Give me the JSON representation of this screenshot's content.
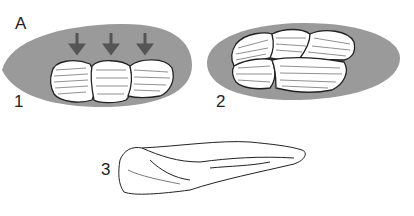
{
  "figure": {
    "panel_label": "A",
    "items": [
      {
        "label": "1",
        "description": "three flakes in a row with downward arrows on gray core"
      },
      {
        "label": "2",
        "description": "overlapping flakes in two rows on gray core"
      },
      {
        "label": "3",
        "description": "elongated stone tool drawing"
      }
    ]
  },
  "colors": {
    "core": "#9a9a9a",
    "line": "#222222",
    "flake": "#ffffff",
    "arrow": "#555555"
  }
}
